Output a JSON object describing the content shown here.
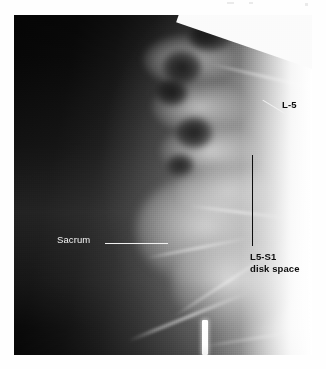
{
  "figure": {
    "kind": "radiograph",
    "modality": "x-ray",
    "view": "lateral lumbosacral spine",
    "plate": {
      "x": 14,
      "y": 15,
      "width": 298,
      "height": 340
    },
    "background_color": "#ffffff",
    "film_dark_color": "#070707",
    "film_bright_color": "#fafafa"
  },
  "annotations": {
    "sacrum": {
      "text": "Sacrum",
      "color": "#f2f2f2",
      "leader_color": "#f0f0f0",
      "leader_style": "horizontal"
    },
    "l5": {
      "text": "L-5",
      "color": "#0d0d0d",
      "leader_color": "#f0f0f0",
      "leader_style": "diagonal"
    },
    "disk_space": {
      "line1": "L5-S1",
      "line2": "disk space",
      "color": "#0d0d0d",
      "leader_color": "#0d0d0d",
      "leader_style": "vertical"
    }
  },
  "markers": {
    "radiopaque": {
      "name": "radiopaque-marker",
      "color": "#ffffff"
    }
  },
  "anatomy": {
    "vertebral_bodies": [
      {
        "cx": 175,
        "cy": 45,
        "rx": 46,
        "ry": 26
      },
      {
        "cx": 186,
        "cy": 92,
        "rx": 48,
        "ry": 27
      },
      {
        "cx": 196,
        "cy": 136,
        "rx": 50,
        "ry": 27
      },
      {
        "cx": 214,
        "cy": 176,
        "rx": 52,
        "ry": 28
      }
    ],
    "spinal_canal": [
      {
        "cx": 168,
        "cy": 52,
        "rx": 20,
        "ry": 17
      },
      {
        "cx": 158,
        "cy": 78,
        "rx": 16,
        "ry": 13
      },
      {
        "cx": 180,
        "cy": 118,
        "rx": 19,
        "ry": 16
      },
      {
        "cx": 166,
        "cy": 150,
        "rx": 14,
        "ry": 11
      },
      {
        "cx": 196,
        "cy": 22,
        "rx": 22,
        "ry": 14
      }
    ],
    "sacral_mass": [
      {
        "cx": 196,
        "cy": 215,
        "rx": 74,
        "ry": 56
      },
      {
        "cx": 220,
        "cy": 268,
        "rx": 62,
        "ry": 48
      }
    ],
    "cortical_streaks": [
      {
        "x": 110,
        "y": 300,
        "w": 130,
        "h": 3,
        "rot": -22
      },
      {
        "x": 150,
        "y": 268,
        "w": 120,
        "h": 2,
        "rot": -33
      },
      {
        "x": 132,
        "y": 232,
        "w": 104,
        "h": 2,
        "rot": -11
      },
      {
        "x": 196,
        "y": 60,
        "w": 104,
        "h": 2,
        "rot": 13
      },
      {
        "x": 176,
        "y": 196,
        "w": 96,
        "h": 2,
        "rot": 7
      },
      {
        "x": 188,
        "y": 322,
        "w": 110,
        "h": 2,
        "rot": -9
      }
    ]
  }
}
